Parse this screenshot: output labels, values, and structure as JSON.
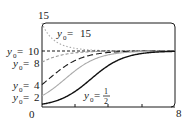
{
  "chart_data": {
    "type": "line",
    "title": "",
    "xlabel": "",
    "ylabel": "",
    "xlim": [
      0,
      8
    ],
    "ylim": [
      0,
      15
    ],
    "x_tick_labels": [
      "0",
      "8"
    ],
    "y_tick_labels": [
      "15"
    ],
    "grid": false,
    "equilibrium": 10,
    "series": [
      {
        "name": "y0 = 15",
        "y0": 15,
        "style": "dotted",
        "color": "#aaaaaa"
      },
      {
        "name": "y0 = 10",
        "y0": 10,
        "style": "dashed",
        "color": "#1a1a1a"
      },
      {
        "name": "y0 = 8",
        "y0": 8,
        "style": "dashed",
        "color": "#999999"
      },
      {
        "name": "y0 = 4",
        "y0": 4,
        "style": "longdash",
        "color": "#1a1a1a"
      },
      {
        "name": "y0 = 2",
        "y0": 2,
        "style": "solid",
        "color": "#aaaaaa"
      },
      {
        "name": "y0 = 1/2",
        "y0": 0.5,
        "style": "solid",
        "color": "#111111"
      }
    ],
    "annotations": [
      "y0 = 15",
      "y0 = 10",
      "y0 = 8",
      "y0 = 4",
      "y0 = 2",
      "y0 = 1/2"
    ]
  },
  "labels": {
    "y_top": "15",
    "x_origin": "0",
    "x_end": "8",
    "y_sym": "y",
    "sub0": "0",
    "eq": " = ",
    "v15": "15",
    "v10": "10",
    "v8": "8",
    "v4": "4",
    "v2": "2",
    "half_num": "1",
    "half_den": "2"
  }
}
